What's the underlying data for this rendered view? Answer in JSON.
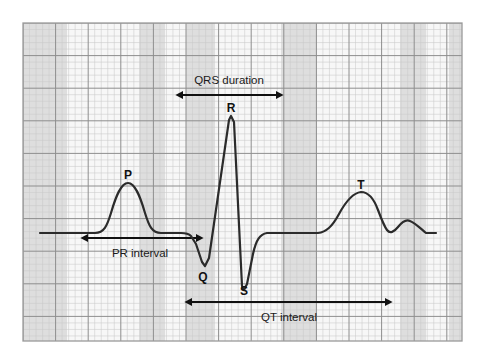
{
  "figure": {
    "background_color": "#ffffff"
  },
  "grid": {
    "x": 23,
    "y": 23,
    "width": 439,
    "height": 318,
    "small_cell_px": 6.52,
    "major_every": 5,
    "minor_line_color": "#c9c9c9",
    "major_line_color": "#8e8e8e",
    "border_color": "#9a9a9a",
    "base_color": "#f7f7f7",
    "band_color": "#dedede",
    "bands": [
      {
        "x": 23,
        "width": 44
      },
      {
        "x": 139,
        "width": 26
      },
      {
        "x": 186,
        "width": 29
      },
      {
        "x": 281,
        "width": 36
      },
      {
        "x": 400,
        "width": 26
      },
      {
        "x": 449,
        "width": 13
      }
    ]
  },
  "trace": {
    "color": "#2b2b2b",
    "stroke_width": 2.2,
    "baseline_y": 233,
    "path": "M 40 233 L 95 233 C 104 233 107 226 111 213 C 116 196 121 183 128 183 C 135 183 140 196 145 213 C 149 226 152 233 161 233 L 181 233 C 186 233 189 234 191 236 L 196 244 C 198 250 200 256 202 262 L 205 266 L 209 258 L 229 120 L 231 116 L 234 122 L 242 286 L 244 290 L 247 284 L 253 254 C 256 240 260 234 267 233 L 318 233 C 326 232 332 227 339 214 C 346 201 353 193 361 192 C 369 192 374 199 378 210 C 381 218 384 226 387 230 C 390 234 394 232 398 227 C 402 222 406 219 410 221 C 415 223 420 228 426 233 L 436 233"
  },
  "wave_labels": [
    {
      "id": "p-wave-label",
      "text": "P",
      "x": 128,
      "y": 179
    },
    {
      "id": "q-wave-label",
      "text": "Q",
      "x": 203,
      "y": 281
    },
    {
      "id": "r-wave-label",
      "text": "R",
      "x": 231,
      "y": 112
    },
    {
      "id": "s-wave-label",
      "text": "S",
      "x": 244,
      "y": 295
    },
    {
      "id": "t-wave-label",
      "text": "T",
      "x": 361,
      "y": 189
    }
  ],
  "annotations": [
    {
      "id": "qrs-duration",
      "label": "QRS duration",
      "label_x": 229,
      "label_y": 84,
      "label_position": "above",
      "arrow_y": 95,
      "arrow_x1": 183,
      "arrow_x2": 276,
      "arrow_color": "#111111",
      "double_headed": true
    },
    {
      "id": "pr-interval",
      "label": "PR interval",
      "label_x": 140,
      "label_y": 257,
      "label_position": "below",
      "arrow_y": 238,
      "arrow_x1": 88,
      "arrow_x2": 196,
      "arrow_color": "#111111",
      "double_headed": true
    },
    {
      "id": "qt-interval",
      "label": "QT interval",
      "label_x": 289,
      "label_y": 321,
      "label_position": "below",
      "arrow_y": 302,
      "arrow_x1": 192,
      "arrow_x2": 385,
      "arrow_color": "#111111",
      "double_headed": true
    }
  ]
}
